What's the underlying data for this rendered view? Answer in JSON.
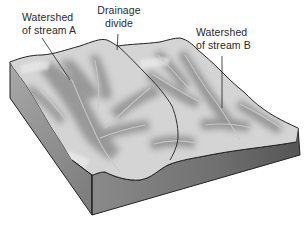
{
  "diagram": {
    "type": "block diagram",
    "labels": {
      "watershed_a": {
        "line1": "Watershed",
        "line2": "of stream A"
      },
      "drainage_divide": {
        "line1": "Drainage",
        "line2": "divide"
      },
      "watershed_b": {
        "line1": "Watershed",
        "line2": "of stream B"
      }
    },
    "colors": {
      "surface_light": "#d9d9d9",
      "surface_mid": "#b5b5b5",
      "valley_dark": "#8e8e8e",
      "stream": "#c8c8c8",
      "side_face_left": "#9a9a9a",
      "front_face": "#7d7d7d",
      "front_face_right": "#5e5e5e",
      "outline": "#222222",
      "label_text": "#2a2a2a"
    }
  }
}
